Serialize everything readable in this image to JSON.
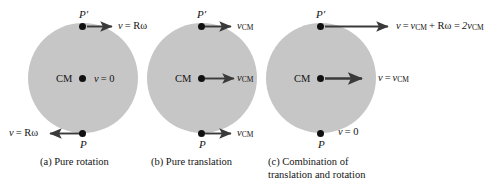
{
  "figure": {
    "background_color": "#ffffff",
    "disc_fill_color": "#c6c6c6",
    "arrow_color": "#3a3a3a",
    "dot_color": "#111111"
  },
  "panels": [
    {
      "id": "a",
      "caption_line1": "(a) Pure rotation",
      "caption_line2": "",
      "center_label": "CM",
      "top_point_label": "P′",
      "bottom_point_label": "P",
      "top_velocity_label_v": "v",
      "top_velocity_label_eq": "= Rω",
      "center_velocity_label_v": "v",
      "center_velocity_label_eq": "= 0",
      "bottom_velocity_label_v": "v",
      "bottom_velocity_label_eq": "= Rω",
      "top_arrow_direction": "right",
      "bottom_arrow_direction": "left",
      "center_arrow": "none"
    },
    {
      "id": "b",
      "caption_line1": "(b) Pure translation",
      "caption_line2": "",
      "center_label": "CM",
      "top_point_label": "P′",
      "bottom_point_label": "P",
      "top_velocity_label_v": "v",
      "top_velocity_label_sub": "CM",
      "center_velocity_label_v": "v",
      "center_velocity_label_sub": "CM",
      "bottom_velocity_label_v": "v",
      "bottom_velocity_label_sub": "CM",
      "top_arrow_direction": "right",
      "bottom_arrow_direction": "right",
      "center_arrow": "right"
    },
    {
      "id": "c",
      "caption_line1": "(c) Combination of",
      "caption_line2": "translation and rotation",
      "center_label": "CM",
      "top_point_label": "P′",
      "bottom_point_label": "P",
      "top_velocity_v": "v",
      "top_velocity_eq1": "=",
      "top_velocity_vcm": "v",
      "top_velocity_vcm_sub": "CM",
      "top_velocity_plus": "+ Rω =",
      "top_velocity_result": "2v",
      "top_velocity_result_sub": "CM",
      "center_velocity_v": "v",
      "center_velocity_eq": "=",
      "center_velocity_vcm": "v",
      "center_velocity_vcm_sub": "CM",
      "bottom_velocity_v": "v",
      "bottom_velocity_eq": "= 0",
      "top_arrow_direction": "right",
      "bottom_arrow": "none",
      "center_arrow": "right"
    }
  ]
}
